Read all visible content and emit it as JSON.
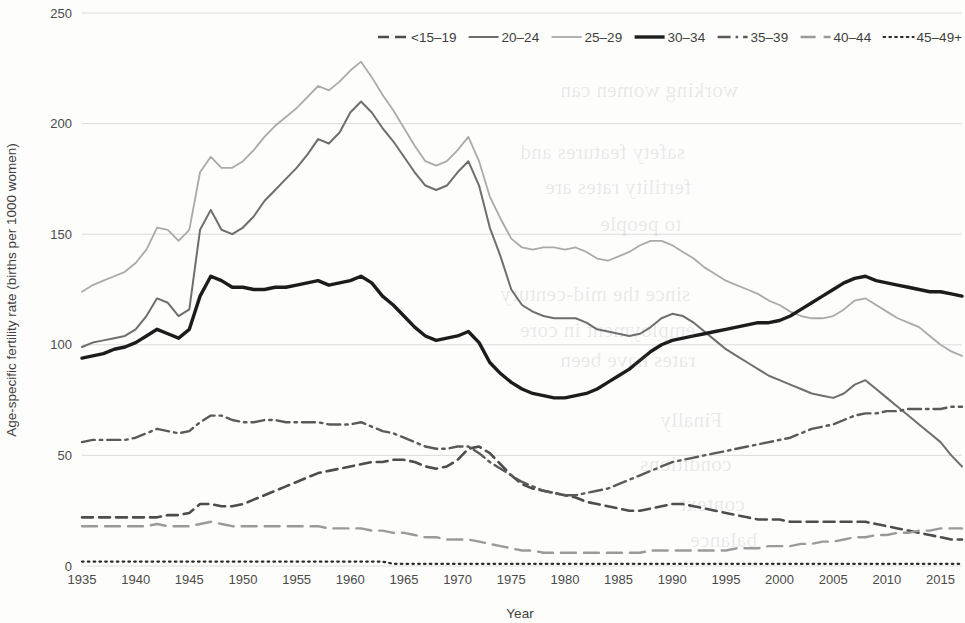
{
  "chart_data": {
    "type": "line",
    "title": "",
    "xlabel": "Year",
    "ylabel": "Age-specific fertility rate (births per 1000 women)",
    "xlim": [
      1935,
      2017
    ],
    "ylim": [
      0,
      250
    ],
    "yticks": [
      0,
      50,
      100,
      150,
      200,
      250
    ],
    "xticks": [
      1935,
      1940,
      1945,
      1950,
      1955,
      1960,
      1965,
      1970,
      1975,
      1980,
      1985,
      1990,
      1995,
      2000,
      2005,
      2010,
      2015
    ],
    "grid": true,
    "legend_position": "top-right",
    "x": [
      1935,
      1936,
      1937,
      1938,
      1939,
      1940,
      1941,
      1942,
      1943,
      1944,
      1945,
      1946,
      1947,
      1948,
      1949,
      1950,
      1951,
      1952,
      1953,
      1954,
      1955,
      1956,
      1957,
      1958,
      1959,
      1960,
      1961,
      1962,
      1963,
      1964,
      1965,
      1966,
      1967,
      1968,
      1969,
      1970,
      1971,
      1972,
      1973,
      1974,
      1975,
      1976,
      1977,
      1978,
      1979,
      1980,
      1981,
      1982,
      1983,
      1984,
      1985,
      1986,
      1987,
      1988,
      1989,
      1990,
      1991,
      1992,
      1993,
      1994,
      1995,
      1996,
      1997,
      1998,
      1999,
      2000,
      2001,
      2002,
      2003,
      2004,
      2005,
      2006,
      2007,
      2008,
      2009,
      2010,
      2011,
      2012,
      2013,
      2014,
      2015,
      2016,
      2017
    ],
    "series": [
      {
        "name": "<15–19",
        "style": "dashed",
        "color": "#4d4d4d",
        "width": 2.6,
        "values": [
          22,
          22,
          22,
          22,
          22,
          22,
          22,
          22,
          23,
          23,
          24,
          28,
          28,
          27,
          27,
          28,
          30,
          32,
          34,
          36,
          38,
          40,
          42,
          43,
          44,
          45,
          46,
          47,
          47,
          48,
          48,
          47,
          45,
          44,
          45,
          48,
          53,
          54,
          51,
          46,
          41,
          37,
          35,
          34,
          33,
          32,
          31,
          29,
          28,
          27,
          26,
          25,
          25,
          26,
          27,
          28,
          28,
          27,
          26,
          25,
          24,
          23,
          22,
          21,
          21,
          21,
          20,
          20,
          20,
          20,
          20,
          20,
          20,
          20,
          19,
          18,
          17,
          16,
          15,
          14,
          13,
          12,
          12
        ]
      },
      {
        "name": "20–24",
        "style": "solid",
        "color": "#6e6e6e",
        "width": 2.0,
        "values": [
          99,
          101,
          102,
          103,
          104,
          107,
          113,
          121,
          119,
          113,
          116,
          152,
          161,
          152,
          150,
          153,
          158,
          165,
          170,
          175,
          180,
          186,
          193,
          191,
          196,
          205,
          210,
          205,
          198,
          192,
          185,
          178,
          172,
          170,
          172,
          178,
          183,
          172,
          153,
          140,
          125,
          118,
          115,
          113,
          112,
          112,
          112,
          110,
          107,
          106,
          105,
          104,
          105,
          108,
          112,
          114,
          113,
          110,
          106,
          102,
          98,
          95,
          92,
          89,
          86,
          84,
          82,
          80,
          78,
          77,
          76,
          78,
          82,
          84,
          80,
          76,
          72,
          68,
          64,
          60,
          56,
          50,
          45
        ]
      },
      {
        "name": "25–29",
        "style": "thin-solid",
        "color": "#aaaaaa",
        "width": 1.8,
        "values": [
          124,
          127,
          129,
          131,
          133,
          137,
          143,
          153,
          152,
          147,
          152,
          178,
          185,
          180,
          180,
          183,
          188,
          194,
          199,
          203,
          207,
          212,
          217,
          215,
          219,
          224,
          228,
          221,
          213,
          206,
          198,
          190,
          183,
          181,
          183,
          188,
          194,
          183,
          167,
          157,
          148,
          144,
          143,
          144,
          144,
          143,
          144,
          142,
          139,
          138,
          140,
          142,
          145,
          147,
          147,
          145,
          142,
          139,
          135,
          132,
          129,
          127,
          125,
          123,
          120,
          118,
          115,
          113,
          112,
          112,
          113,
          116,
          120,
          121,
          118,
          115,
          112,
          110,
          108,
          104,
          100,
          97,
          95
        ]
      },
      {
        "name": "30–34",
        "style": "thick-solid",
        "color": "#1c1c1c",
        "width": 3.4,
        "values": [
          94,
          95,
          96,
          98,
          99,
          101,
          104,
          107,
          105,
          103,
          107,
          122,
          131,
          129,
          126,
          126,
          125,
          125,
          126,
          126,
          127,
          128,
          129,
          127,
          128,
          129,
          131,
          128,
          122,
          118,
          113,
          108,
          104,
          102,
          103,
          104,
          106,
          101,
          92,
          87,
          83,
          80,
          78,
          77,
          76,
          76,
          77,
          78,
          80,
          83,
          86,
          89,
          93,
          97,
          100,
          102,
          103,
          104,
          105,
          106,
          107,
          108,
          109,
          110,
          110,
          111,
          113,
          116,
          119,
          122,
          125,
          128,
          130,
          131,
          129,
          128,
          127,
          126,
          125,
          124,
          124,
          123,
          122
        ]
      },
      {
        "name": "35–39",
        "style": "dash-dot",
        "color": "#5a5a5a",
        "width": 2.4,
        "values": [
          56,
          57,
          57,
          57,
          57,
          58,
          60,
          62,
          61,
          60,
          61,
          65,
          68,
          68,
          66,
          65,
          65,
          66,
          66,
          65,
          65,
          65,
          65,
          64,
          64,
          64,
          65,
          63,
          61,
          60,
          58,
          56,
          54,
          53,
          53,
          54,
          54,
          51,
          47,
          44,
          41,
          38,
          36,
          34,
          33,
          32,
          32,
          33,
          34,
          35,
          37,
          39,
          41,
          43,
          45,
          47,
          48,
          49,
          50,
          51,
          52,
          53,
          54,
          55,
          56,
          57,
          58,
          60,
          62,
          63,
          64,
          66,
          68,
          69,
          69,
          70,
          70,
          71,
          71,
          71,
          71,
          72,
          72
        ]
      },
      {
        "name": "40–44",
        "style": "long-dash",
        "color": "#9a9a9a",
        "width": 2.4,
        "values": [
          18,
          18,
          18,
          18,
          18,
          18,
          18,
          19,
          18,
          18,
          18,
          19,
          20,
          19,
          18,
          18,
          18,
          18,
          18,
          18,
          18,
          18,
          18,
          17,
          17,
          17,
          17,
          16,
          16,
          15,
          15,
          14,
          13,
          13,
          12,
          12,
          12,
          11,
          10,
          9,
          8,
          7,
          7,
          6,
          6,
          6,
          6,
          6,
          6,
          6,
          6,
          6,
          6,
          7,
          7,
          7,
          7,
          7,
          7,
          7,
          7,
          8,
          8,
          8,
          9,
          9,
          9,
          10,
          10,
          11,
          11,
          12,
          13,
          13,
          14,
          14,
          15,
          15,
          16,
          16,
          17,
          17,
          17
        ]
      },
      {
        "name": "45–49+",
        "style": "dotted",
        "color": "#2a2a2a",
        "width": 2.2,
        "values": [
          2,
          2,
          2,
          2,
          2,
          2,
          2,
          2,
          2,
          2,
          2,
          2,
          2,
          2,
          2,
          2,
          2,
          2,
          2,
          2,
          2,
          2,
          2,
          2,
          2,
          2,
          2,
          2,
          2,
          1,
          1,
          1,
          1,
          1,
          1,
          1,
          1,
          1,
          1,
          1,
          1,
          1,
          1,
          1,
          1,
          1,
          1,
          1,
          1,
          1,
          1,
          1,
          1,
          1,
          1,
          1,
          1,
          1,
          1,
          1,
          1,
          1,
          1,
          1,
          1,
          1,
          1,
          1,
          1,
          1,
          1,
          1,
          1,
          1,
          1,
          1,
          1,
          1,
          1,
          1,
          1,
          1,
          1
        ]
      }
    ]
  },
  "ghost_text": [
    {
      "text": "working women can",
      "x": 560,
      "y": 78
    },
    {
      "text": "safety features and",
      "x": 520,
      "y": 140
    },
    {
      "text": "fertility rates are",
      "x": 545,
      "y": 175
    },
    {
      "text": "to people",
      "x": 600,
      "y": 212
    },
    {
      "text": "since the mid-century",
      "x": 500,
      "y": 282
    },
    {
      "text": "employment in core",
      "x": 520,
      "y": 318
    },
    {
      "text": "rates have been",
      "x": 560,
      "y": 348
    },
    {
      "text": "Finally",
      "x": 660,
      "y": 408
    },
    {
      "text": "conditions",
      "x": 640,
      "y": 452
    },
    {
      "text": "context",
      "x": 680,
      "y": 492
    },
    {
      "text": "balance",
      "x": 690,
      "y": 528
    }
  ]
}
